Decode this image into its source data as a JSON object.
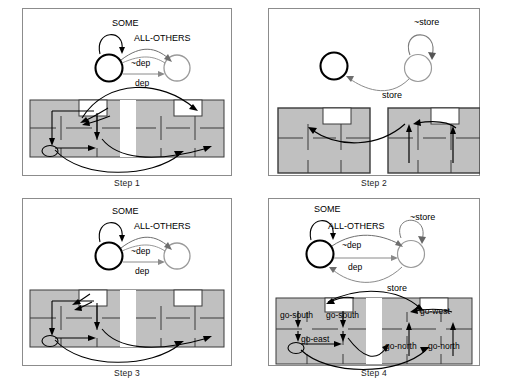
{
  "figure": {
    "type": "multi-panel-diagram",
    "background_color": "#ffffff",
    "panel_border_color": "#8c8c8c",
    "grid_fill_color": "#c0c0c0",
    "grid_line_color": "#333333",
    "room_fill_color": "#ffffff",
    "arrow_color": "#000000",
    "thin_arc_color": "#555555",
    "panels": [
      {
        "id": "panel-1",
        "caption": "Step 1",
        "automaton": {
          "states": [
            {
              "id": "s0",
              "style": "bold",
              "label": ""
            },
            {
              "id": "s1",
              "style": "light",
              "label": ""
            }
          ],
          "transitions": [
            {
              "label": "SOME",
              "kind": "self-loop",
              "from": "s0",
              "to": "s0"
            },
            {
              "label": "ALL-OTHERS",
              "kind": "curve",
              "from": "s0",
              "to": "s1"
            },
            {
              "label": "~dep",
              "kind": "curve",
              "from": "s0",
              "to": "s1"
            },
            {
              "label": "dep",
              "kind": "straight",
              "from": "s0",
              "to": "s1"
            }
          ]
        },
        "map": {
          "layout": "joined",
          "labels": []
        }
      },
      {
        "id": "panel-2",
        "caption": "Step 2",
        "automaton": {
          "states": [
            {
              "id": "s0",
              "style": "bold",
              "label": ""
            },
            {
              "id": "s1",
              "style": "light",
              "label": ""
            }
          ],
          "transitions": [
            {
              "label": "~store",
              "kind": "self-loop",
              "from": "s1",
              "to": "s1"
            },
            {
              "label": "store",
              "kind": "curve",
              "from": "s1",
              "to": "s0"
            }
          ]
        },
        "map": {
          "layout": "split",
          "labels": []
        }
      },
      {
        "id": "panel-3",
        "caption": "Step 3",
        "automaton": {
          "states": [
            {
              "id": "s0",
              "style": "bold",
              "label": ""
            },
            {
              "id": "s1",
              "style": "light",
              "label": ""
            }
          ],
          "transitions": [
            {
              "label": "SOME",
              "kind": "self-loop",
              "from": "s0",
              "to": "s0"
            },
            {
              "label": "ALL-OTHERS",
              "kind": "curve",
              "from": "s0",
              "to": "s1"
            },
            {
              "label": "~dep",
              "kind": "curve",
              "from": "s0",
              "to": "s1"
            },
            {
              "label": "dep",
              "kind": "straight",
              "from": "s0",
              "to": "s1"
            }
          ]
        },
        "map": {
          "layout": "joined",
          "labels": []
        }
      },
      {
        "id": "panel-4",
        "caption": "Step 4",
        "automaton": {
          "states": [
            {
              "id": "s0",
              "style": "bold",
              "label": ""
            },
            {
              "id": "s1",
              "style": "light",
              "label": ""
            }
          ],
          "transitions": [
            {
              "label": "SOME",
              "kind": "self-loop",
              "from": "s0",
              "to": "s0"
            },
            {
              "label": "ALL-OTHERS",
              "kind": "curve",
              "from": "s0",
              "to": "s1"
            },
            {
              "label": "~store",
              "kind": "self-loop",
              "from": "s1",
              "to": "s1"
            },
            {
              "label": "~dep",
              "kind": "curve",
              "from": "s0",
              "to": "s1"
            },
            {
              "label": "dep",
              "kind": "straight",
              "from": "s0",
              "to": "s1"
            },
            {
              "label": "store",
              "kind": "curve",
              "from": "s1",
              "to": "s0"
            }
          ]
        },
        "map": {
          "layout": "joined",
          "labels": [
            {
              "text": "go-south",
              "x": 31,
              "y": 45
            },
            {
              "text": "go-south",
              "x": 88,
              "y": 45
            },
            {
              "text": "go-east",
              "x": 47,
              "y": 76
            },
            {
              "text": "go-west",
              "x": 163,
              "y": 42
            },
            {
              "text": "go-north",
              "x": 131,
              "y": 83
            },
            {
              "text": "go-north",
              "x": 176,
              "y": 83
            }
          ]
        }
      }
    ]
  },
  "text": {
    "some": "SOME",
    "all_others": "ALL-OTHERS",
    "not_dep": "~dep",
    "dep": "dep",
    "not_store": "~store",
    "store": "store",
    "go_south": "go-south",
    "go_east": "go-east",
    "go_north": "go-north",
    "go_west": "go-west",
    "step1": "Step 1",
    "step2": "Step 2",
    "step3": "Step 3",
    "step4": "Step 4"
  }
}
